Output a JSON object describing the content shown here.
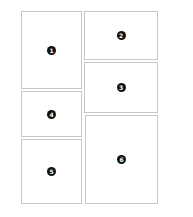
{
  "diagram": {
    "title": "",
    "panels": [
      {
        "id": "1",
        "label": "1",
        "x": 21,
        "y": 11,
        "w": 61,
        "h": 78
      },
      {
        "id": "2",
        "label": "2",
        "x": 84,
        "y": 11,
        "w": 74,
        "h": 49
      },
      {
        "id": "3",
        "label": "3",
        "x": 84,
        "y": 62,
        "w": 74,
        "h": 51
      },
      {
        "id": "4",
        "label": "4",
        "x": 21,
        "y": 91,
        "w": 61,
        "h": 46
      },
      {
        "id": "5",
        "label": "5",
        "x": 21,
        "y": 139,
        "w": 61,
        "h": 65
      },
      {
        "id": "6",
        "label": "6",
        "x": 85,
        "y": 115,
        "w": 73,
        "h": 89
      }
    ],
    "colors": {
      "border": "#c8c8c8",
      "badge": "#111111",
      "badge_text": "#ffffff",
      "background": "#ffffff"
    }
  }
}
